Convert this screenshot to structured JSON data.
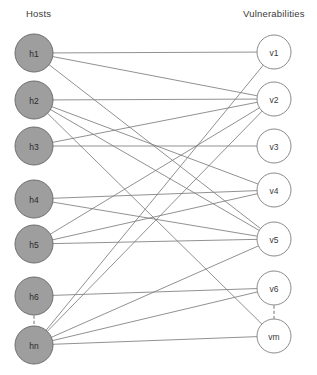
{
  "diagram": {
    "columns": {
      "left_title": "Hosts",
      "right_title": "Vulnerabilities"
    },
    "style": {
      "host_fill": "#9e9e9e",
      "host_stroke": "#6e6e6e",
      "vuln_fill": "#ffffff",
      "vuln_stroke": "#8a8a8a",
      "edge_color": "#7d7d7d",
      "ellipsis_color": "#9a9a9a",
      "background": "#ffffff"
    },
    "hosts": [
      {
        "id": "h1",
        "label": "h1",
        "cx": 34,
        "cy": 53,
        "r": 19
      },
      {
        "id": "h2",
        "label": "h2",
        "cx": 34,
        "cy": 100,
        "r": 19
      },
      {
        "id": "h3",
        "label": "h3",
        "cx": 34,
        "cy": 146,
        "r": 19
      },
      {
        "id": "h4",
        "label": "h4",
        "cx": 34,
        "cy": 199,
        "r": 19
      },
      {
        "id": "h5",
        "label": "h5",
        "cx": 34,
        "cy": 244,
        "r": 19
      },
      {
        "id": "h6",
        "label": "h6",
        "cx": 34,
        "cy": 296,
        "r": 19
      },
      {
        "id": "hn",
        "label": "hn",
        "cx": 34,
        "cy": 345,
        "r": 19
      }
    ],
    "vulnerabilities": [
      {
        "id": "v1",
        "label": "v1",
        "cx": 274,
        "cy": 52,
        "r": 17
      },
      {
        "id": "v2",
        "label": "v2",
        "cx": 274,
        "cy": 99,
        "r": 17
      },
      {
        "id": "v3",
        "label": "v3",
        "cx": 274,
        "cy": 146,
        "r": 17
      },
      {
        "id": "v4",
        "label": "v4",
        "cx": 274,
        "cy": 190,
        "r": 17
      },
      {
        "id": "v5",
        "label": "v5",
        "cx": 274,
        "cy": 239,
        "r": 17
      },
      {
        "id": "v6",
        "label": "v6",
        "cx": 274,
        "cy": 288,
        "r": 17
      },
      {
        "id": "vm",
        "label": "vm",
        "cx": 274,
        "cy": 336,
        "r": 17
      }
    ],
    "ellipses": [
      {
        "name": "host-ellipsis",
        "x": 34,
        "y1": 316,
        "y2": 326
      },
      {
        "name": "vuln-ellipsis",
        "x": 274,
        "y1": 306,
        "y2": 319
      }
    ],
    "edges": [
      {
        "from": "h1",
        "to": "v1"
      },
      {
        "from": "h1",
        "to": "v2"
      },
      {
        "from": "h1",
        "to": "v5"
      },
      {
        "from": "h2",
        "to": "v2"
      },
      {
        "from": "h2",
        "to": "v4"
      },
      {
        "from": "h2",
        "to": "v5"
      },
      {
        "from": "h2",
        "to": "vm"
      },
      {
        "from": "h3",
        "to": "v3"
      },
      {
        "from": "h3",
        "to": "v2"
      },
      {
        "from": "h4",
        "to": "v4"
      },
      {
        "from": "h4",
        "to": "v5"
      },
      {
        "from": "h5",
        "to": "v2"
      },
      {
        "from": "h5",
        "to": "v4"
      },
      {
        "from": "h5",
        "to": "v5"
      },
      {
        "from": "h6",
        "to": "v6"
      },
      {
        "from": "hn",
        "to": "v1"
      },
      {
        "from": "hn",
        "to": "v2"
      },
      {
        "from": "hn",
        "to": "v5"
      },
      {
        "from": "hn",
        "to": "v6"
      },
      {
        "from": "hn",
        "to": "vm"
      }
    ]
  }
}
